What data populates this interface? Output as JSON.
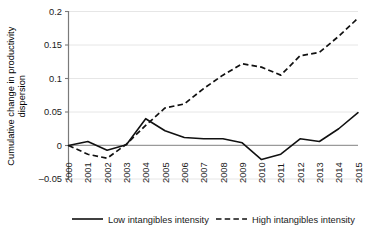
{
  "chart_data": {
    "type": "line",
    "title": "",
    "xlabel": "",
    "ylabel": "Cumulative change in productivity dispersion",
    "ylabel_line1": "Cumulative change in productivity",
    "ylabel_line2": "dispersion",
    "categories": [
      "2000",
      "2001",
      "2002",
      "2003",
      "2004",
      "2005",
      "2006",
      "2007",
      "2008",
      "2009",
      "2010",
      "2011",
      "2012",
      "2013",
      "2014",
      "2015"
    ],
    "x": [
      2000,
      2001,
      2002,
      2003,
      2004,
      2005,
      2006,
      2007,
      2008,
      2009,
      2010,
      2011,
      2012,
      2013,
      2014,
      2015
    ],
    "ylim": [
      -0.05,
      0.2
    ],
    "xlim": [
      2000,
      2015
    ],
    "yticks": [
      -0.05,
      0,
      0.05,
      0.1,
      0.15,
      0.2
    ],
    "ytick_labels": [
      "–0.05",
      "0",
      "0.05",
      "0.1",
      "0.15",
      "0.2"
    ],
    "grid": true,
    "grid_axis": "y",
    "legend_position": "bottom",
    "series": [
      {
        "name": "Low intangibles intensity",
        "style": "solid",
        "color": "#111111",
        "values": [
          0,
          0.006,
          -0.007,
          0.001,
          0.04,
          0.022,
          0.012,
          0.01,
          0.01,
          0.004,
          -0.021,
          -0.013,
          0.01,
          0.006,
          0.025,
          0.049
        ]
      },
      {
        "name": "High intangibles intensity",
        "style": "dashed",
        "color": "#111111",
        "values": [
          0,
          -0.013,
          -0.019,
          0.002,
          0.03,
          0.056,
          0.062,
          0.085,
          0.105,
          0.122,
          0.117,
          0.105,
          0.134,
          0.139,
          0.163,
          0.19
        ]
      }
    ]
  },
  "legend": {
    "items": [
      {
        "label": "Low intangibles intensity",
        "style": "solid"
      },
      {
        "label": "High intangibles intensity",
        "style": "dashed"
      }
    ]
  }
}
